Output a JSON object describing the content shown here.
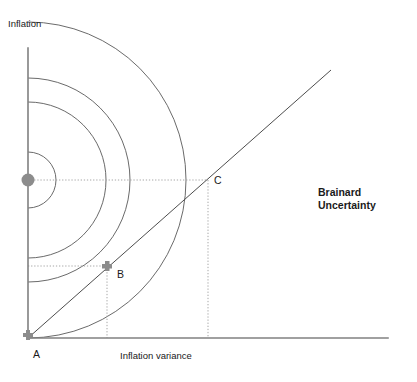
{
  "figure": {
    "title_annotation": "Brainard Uncertainty",
    "axes": {
      "y_label": "Inflation",
      "x_label": "Inflation variance",
      "origin": {
        "x": 28,
        "y": 338
      },
      "y_top": 48,
      "x_right": 388,
      "axis_color": "#808080"
    },
    "points": [
      {
        "id": "A",
        "label": "A",
        "x": 28,
        "y": 338,
        "marker": "cross",
        "color": "#8c8c8c"
      },
      {
        "id": "B",
        "label": "B",
        "x": 107,
        "y": 266,
        "marker": "cross",
        "color": "#8c8c8c"
      },
      {
        "id": "C",
        "label": "C",
        "x": 208,
        "y": 180,
        "marker": "none",
        "color": "#8c8c8c"
      },
      {
        "id": "center",
        "label": "",
        "x": 28,
        "y": 180,
        "marker": "dot",
        "color": "#8c8c8c"
      }
    ],
    "ray": {
      "name": "policy-ray",
      "from": {
        "x": 28,
        "y": 338
      },
      "to": {
        "x": 331,
        "y": 70
      },
      "color": "#4d4d4d"
    },
    "arcs": {
      "name": "indifference-arcs",
      "center": {
        "x": 28,
        "y": 180
      },
      "radii": [
        28,
        78,
        102,
        158
      ],
      "color": "#595959"
    },
    "guides": [
      {
        "name": "guide-b-horizontal",
        "x1": 28,
        "y1": 266,
        "x2": 107,
        "y2": 266
      },
      {
        "name": "guide-b-vertical",
        "x1": 107,
        "y1": 266,
        "x2": 107,
        "y2": 338
      },
      {
        "name": "guide-c-horizontal",
        "x1": 28,
        "y1": 180,
        "x2": 208,
        "y2": 180
      },
      {
        "name": "guide-c-vertical",
        "x1": 208,
        "y1": 180,
        "x2": 208,
        "y2": 338
      }
    ],
    "guide_color": "#a6a6a6",
    "brainard_line_1": "Brainard",
    "brainard_line_2": "Uncertainty"
  }
}
